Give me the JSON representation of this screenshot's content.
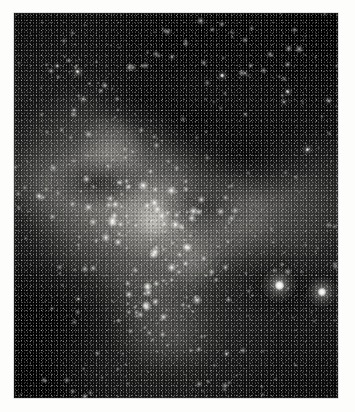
{
  "document": {
    "type": "photograph",
    "subject": "star-field",
    "orientation": "portrait",
    "rendering": "monochrome",
    "caption": "",
    "page_background": "#fdfdfc"
  },
  "plate": {
    "x": 14,
    "y": 13,
    "width": 324,
    "height": 385,
    "background": "#080808",
    "border_color": "#8c8c8c",
    "palette": {
      "sky_dark": "#080808",
      "sky_mid": "#171717",
      "band_light": "#bebcb6",
      "star_white": "#ffffff",
      "dust_black": "#000000",
      "margin_white": "#fdfdfc"
    }
  },
  "features": [
    {
      "name": "star-cluster-upper-left",
      "cx": 0.2,
      "cy": 0.15,
      "radius": 0.09,
      "brightness": 0.72
    },
    {
      "name": "milky-way-band",
      "cx": 0.42,
      "cy": 0.56,
      "radius": 0.4,
      "brightness": 0.62
    },
    {
      "name": "bright-nebula-knot",
      "cx": 0.43,
      "cy": 0.54,
      "radius": 0.06,
      "brightness": 0.92
    },
    {
      "name": "dark-dust-lane-upper",
      "cx": 0.55,
      "cy": 0.28,
      "radius": 0.2,
      "brightness": 0.06
    },
    {
      "name": "dark-dust-lane-right",
      "cx": 0.74,
      "cy": 0.37,
      "radius": 0.22,
      "brightness": 0.08
    },
    {
      "name": "dark-region-lower-left",
      "cx": 0.12,
      "cy": 0.8,
      "radius": 0.26,
      "brightness": 0.07
    }
  ],
  "bright_stars": [
    {
      "name": "bright-star-primary",
      "x": 0.818,
      "y": 0.707,
      "core": 9.0,
      "halo": 34,
      "intensity": 1.0
    },
    {
      "name": "bright-star-secondary",
      "x": 0.951,
      "y": 0.725,
      "core": 8.0,
      "halo": 30,
      "intensity": 0.96
    },
    {
      "name": "star-upper-left-a",
      "x": 0.196,
      "y": 0.152,
      "core": 3.4,
      "halo": 12,
      "intensity": 0.78
    },
    {
      "name": "star-upper-left-b",
      "x": 0.134,
      "y": 0.137,
      "core": 2.2,
      "halo": 8,
      "intensity": 0.62
    },
    {
      "name": "star-upper-left-c",
      "x": 0.213,
      "y": 0.224,
      "core": 2.3,
      "halo": 9,
      "intensity": 0.66
    },
    {
      "name": "star-upper-left-d",
      "x": 0.186,
      "y": 0.253,
      "core": 2.0,
      "halo": 8,
      "intensity": 0.6
    },
    {
      "name": "star-upper-mid-a",
      "x": 0.487,
      "y": 0.115,
      "core": 2.1,
      "halo": 8,
      "intensity": 0.6
    },
    {
      "name": "star-upper-right-a",
      "x": 0.642,
      "y": 0.162,
      "core": 3.1,
      "halo": 11,
      "intensity": 0.76
    },
    {
      "name": "star-upper-right-b",
      "x": 0.714,
      "y": 0.157,
      "core": 2.0,
      "halo": 7,
      "intensity": 0.56
    },
    {
      "name": "star-upper-right-c",
      "x": 0.845,
      "y": 0.204,
      "core": 2.6,
      "halo": 10,
      "intensity": 0.7
    },
    {
      "name": "star-upper-right-d",
      "x": 0.832,
      "y": 0.232,
      "core": 2.1,
      "halo": 8,
      "intensity": 0.6
    },
    {
      "name": "star-upper-right-e",
      "x": 0.972,
      "y": 0.228,
      "core": 2.4,
      "halo": 9,
      "intensity": 0.66
    },
    {
      "name": "star-mid-right-a",
      "x": 0.906,
      "y": 0.355,
      "core": 3.0,
      "halo": 11,
      "intensity": 0.78
    },
    {
      "name": "star-mid-right-b",
      "x": 0.713,
      "y": 0.263,
      "core": 1.9,
      "halo": 7,
      "intensity": 0.54
    },
    {
      "name": "star-mid-left-a",
      "x": 0.077,
      "y": 0.475,
      "core": 2.4,
      "halo": 9,
      "intensity": 0.66
    },
    {
      "name": "star-mid-centre-a",
      "x": 0.509,
      "y": 0.672,
      "core": 2.2,
      "halo": 8,
      "intensity": 0.62
    },
    {
      "name": "star-lower-left-a",
      "x": 0.199,
      "y": 0.742,
      "core": 2.1,
      "halo": 8,
      "intensity": 0.6
    },
    {
      "name": "star-lower-centre-a",
      "x": 0.656,
      "y": 0.885,
      "core": 2.3,
      "halo": 9,
      "intensity": 0.64
    },
    {
      "name": "star-lower-centre-b",
      "x": 0.54,
      "y": 0.762,
      "core": 1.8,
      "halo": 7,
      "intensity": 0.52
    },
    {
      "name": "star-centre-a",
      "x": 0.291,
      "y": 0.398,
      "core": 1.9,
      "halo": 7,
      "intensity": 0.55
    },
    {
      "name": "star-centre-b",
      "x": 0.354,
      "y": 0.449,
      "core": 1.7,
      "halo": 6,
      "intensity": 0.5
    }
  ],
  "field_stars": {
    "count": 1500,
    "description": "dense stellar background, brightest along the milky way band"
  }
}
